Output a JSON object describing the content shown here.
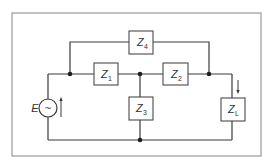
{
  "diagram": {
    "type": "electrical-circuit",
    "source": {
      "label": "E",
      "symbol": "~"
    },
    "impedances": [
      {
        "id": "Z1",
        "main": "Z",
        "sub": "1"
      },
      {
        "id": "Z2",
        "main": "Z",
        "sub": "2"
      },
      {
        "id": "Z3",
        "main": "Z",
        "sub": "3"
      },
      {
        "id": "Z4",
        "main": "Z",
        "sub": "4"
      },
      {
        "id": "ZL",
        "main": "Z",
        "sub": "L"
      }
    ],
    "colors": {
      "wire": "#3a3a3a",
      "frame": "#9a9a9a",
      "node": "#1e1e1e",
      "background": "#ffffff"
    }
  }
}
